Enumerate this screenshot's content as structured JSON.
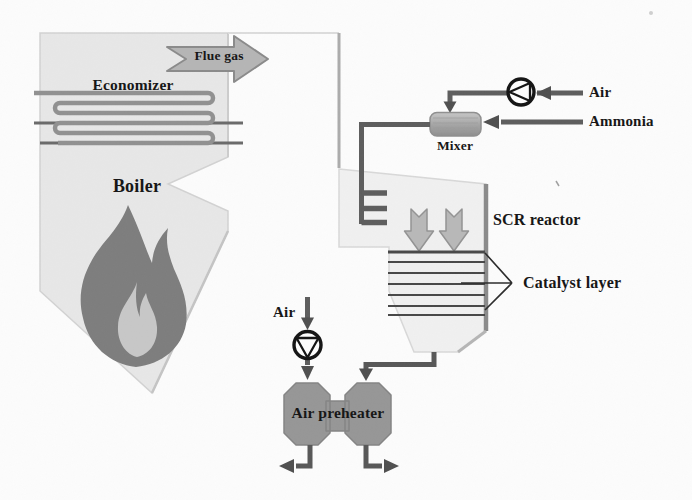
{
  "labels": {
    "flue_gas": "Flue gas",
    "economizer": "Economizer",
    "boiler": "Boiler",
    "air_top": "Air",
    "ammonia": "Ammonia",
    "mixer": "Mixer",
    "scr_reactor": "SCR reactor",
    "catalyst_layer": "Catalyst layer",
    "air_bottom": "Air",
    "air_preheater": "Air preheater"
  },
  "components": [
    {
      "name": "Boiler",
      "type": "vessel-with-flame"
    },
    {
      "name": "Economizer",
      "type": "serpentine-coil"
    },
    {
      "name": "Mixer",
      "type": "inline-mixer"
    },
    {
      "name": "SCR reactor",
      "type": "vessel"
    },
    {
      "name": "Catalyst layer",
      "type": "layer-stack"
    },
    {
      "name": "Air preheater",
      "type": "heat-exchanger"
    },
    {
      "name": "air-blower-top",
      "type": "fan-symbol"
    },
    {
      "name": "air-blower-bottom",
      "type": "fan-symbol"
    },
    {
      "name": "ammonia-injection-grid",
      "type": "three-branch-manifold"
    }
  ],
  "catalyst_layer_count": 7,
  "flows": [
    "Flue gas: Boiler → duct → SCR reactor",
    "Air → blower → Mixer",
    "Ammonia → Mixer",
    "Mixer → injection grid → SCR reactor",
    "SCR reactor → Air preheater",
    "Air → blower → Air preheater",
    "Air preheater → left outlet",
    "Air preheater → right outlet"
  ],
  "colors": {
    "background": "#fcfcfc",
    "boiler_fill": "#e7e7e7",
    "reactor_fill": "#f0f0f0",
    "flame_outer": "#7d7d7d",
    "flame_inner": "#c7c7c7",
    "pipe": "#5d5d5d",
    "block_arrow_fill": "#b5b5b5",
    "equipment_fill": "#969696",
    "catalyst_line": "#474747",
    "text": "#171717"
  }
}
